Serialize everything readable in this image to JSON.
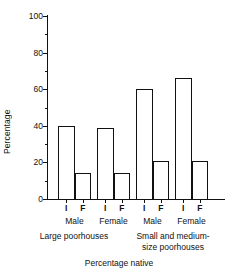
{
  "chart_data": {
    "type": "bar",
    "title": "",
    "xlabel": "Percentage native",
    "ylabel": "Percentage",
    "ylim": [
      0,
      100
    ],
    "yticks": [
      0,
      20,
      40,
      60,
      80,
      100
    ],
    "yticks_minor": [
      10,
      30,
      50,
      70,
      90
    ],
    "grid": false,
    "legend": "none",
    "categories": [
      "I",
      "F",
      "I",
      "F",
      "I",
      "F",
      "I",
      "F"
    ],
    "values": [
      40,
      14,
      39,
      14,
      60,
      21,
      66,
      21
    ],
    "groups": [
      {
        "label": "Male",
        "categories": [
          "I",
          "F"
        ],
        "values": [
          40,
          14
        ]
      },
      {
        "label": "Female",
        "categories": [
          "I",
          "F"
        ],
        "values": [
          39,
          14
        ]
      },
      {
        "label": "Male",
        "categories": [
          "I",
          "F"
        ],
        "values": [
          60,
          21
        ]
      },
      {
        "label": "Female",
        "categories": [
          "I",
          "F"
        ],
        "values": [
          66,
          21
        ]
      }
    ],
    "supergroups": [
      {
        "label": "Large poorhouses",
        "line1": "Large poorhouses",
        "line2": "",
        "groups": [
          "Male",
          "Female"
        ]
      },
      {
        "label": "Small and medium-size poorhouses",
        "line1": "Small and medium-",
        "line2": "size poorhouses",
        "groups": [
          "Male",
          "Female"
        ]
      }
    ],
    "series": [
      {
        "name": "Percentage native",
        "values": [
          40,
          14,
          39,
          14,
          60,
          21,
          66,
          21
        ]
      }
    ],
    "bar_color": "#ffffff",
    "bar_edge_color": "#111111",
    "axis_color": "#111111"
  }
}
